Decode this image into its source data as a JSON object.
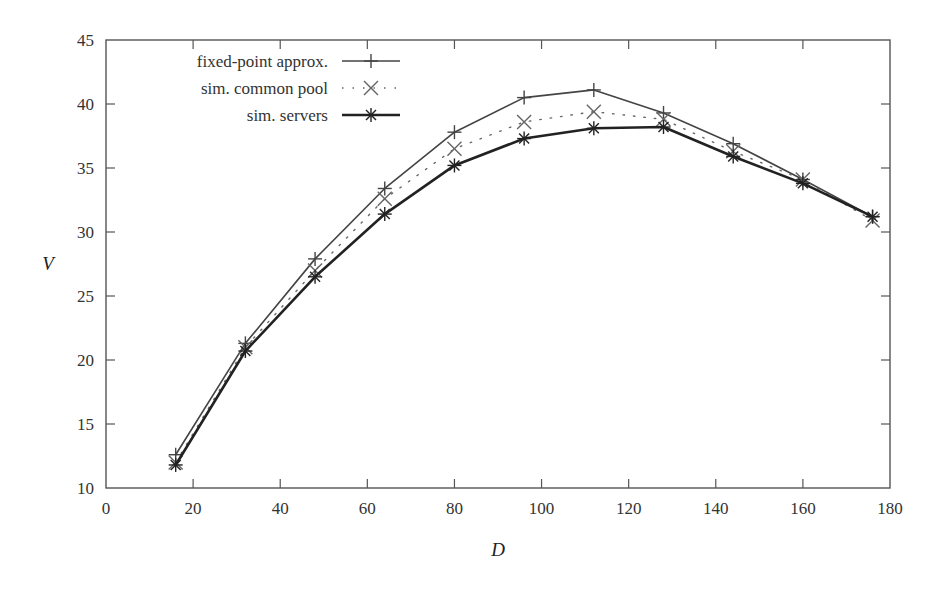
{
  "chart_data": {
    "type": "line",
    "title": "",
    "xlabel": "D",
    "ylabel": "V",
    "xlim": [
      0,
      180
    ],
    "ylim": [
      10,
      45
    ],
    "xticks": [
      0,
      20,
      40,
      60,
      80,
      100,
      120,
      140,
      160,
      180
    ],
    "yticks": [
      10,
      15,
      20,
      25,
      30,
      35,
      40,
      45
    ],
    "grid": false,
    "legend_position": "top-left",
    "x": [
      16,
      32,
      48,
      64,
      80,
      96,
      112,
      128,
      144,
      160,
      176
    ],
    "series": [
      {
        "name": "fixed-point approx.",
        "marker": "plus",
        "line": "solid-thin",
        "color": "#444444",
        "values": [
          12.6,
          21.3,
          27.9,
          33.4,
          37.8,
          40.5,
          41.1,
          39.3,
          36.9,
          34.1,
          31.2
        ]
      },
      {
        "name": "sim. common pool",
        "marker": "cross",
        "line": "dotted",
        "color": "#666666",
        "values": [
          12.0,
          21.0,
          27.0,
          32.6,
          36.5,
          38.6,
          39.4,
          38.8,
          36.3,
          34.1,
          30.9
        ]
      },
      {
        "name": "sim. servers",
        "marker": "star",
        "line": "solid-thick",
        "color": "#222222",
        "values": [
          11.8,
          20.7,
          26.5,
          31.4,
          35.2,
          37.3,
          38.1,
          38.2,
          35.9,
          33.8,
          31.2
        ]
      }
    ]
  },
  "labels": {
    "xlabel": "D",
    "ylabel": "V",
    "legend": [
      "fixed-point approx.",
      "sim. common pool",
      "sim. servers"
    ]
  }
}
